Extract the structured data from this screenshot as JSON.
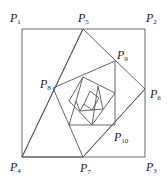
{
  "diagram": {
    "type": "nested-squares-spiral",
    "stroke_color": "#555555",
    "background": "#ffffff",
    "labels": [
      {
        "id": "P1",
        "letter": "P",
        "sub": "1",
        "x": 10,
        "y": 12
      },
      {
        "id": "P2",
        "letter": "P",
        "sub": "2",
        "x": 146,
        "y": 12
      },
      {
        "id": "P3",
        "letter": "P",
        "sub": "3",
        "x": 146,
        "y": 162
      },
      {
        "id": "P4",
        "letter": "P",
        "sub": "4",
        "x": 10,
        "y": 162
      },
      {
        "id": "P5",
        "letter": "P",
        "sub": "5",
        "x": 78,
        "y": 12
      },
      {
        "id": "P6",
        "letter": "P",
        "sub": "6",
        "x": 150,
        "y": 89
      },
      {
        "id": "P7",
        "letter": "P",
        "sub": "7",
        "x": 80,
        "y": 163
      },
      {
        "id": "P8",
        "letter": "P",
        "sub": "8",
        "x": 40,
        "y": 77
      },
      {
        "id": "P9",
        "letter": "P",
        "sub": "9",
        "x": 117,
        "y": 49
      },
      {
        "id": "P10",
        "letter": "P",
        "sub": "10",
        "x": 114,
        "y": 131
      }
    ]
  }
}
